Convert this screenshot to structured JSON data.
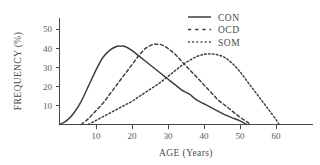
{
  "chart_data": {
    "type": "line",
    "title": "",
    "xlabel": "AGE (Years)",
    "ylabel": "FREQUENCY (%)",
    "xlim": [
      0,
      70
    ],
    "ylim": [
      0,
      57
    ],
    "xticks": [
      10,
      20,
      30,
      40,
      50,
      60
    ],
    "yticks": [
      10,
      20,
      30,
      40,
      50
    ],
    "grid": false,
    "legend_position": "top-right",
    "series": [
      {
        "name": "CON",
        "style": "solid",
        "peak_x": 17,
        "peak_y": 41,
        "x": [
          0,
          2,
          4,
          6,
          8,
          10,
          12,
          14,
          16,
          17,
          18,
          20,
          22,
          24,
          26,
          28,
          30,
          32,
          34,
          36,
          38,
          40,
          42,
          44,
          46,
          48,
          50,
          52
        ],
        "y": [
          0,
          2,
          6,
          12,
          20,
          28,
          35,
          39,
          41,
          41,
          41,
          39,
          36,
          33,
          30,
          27,
          24,
          21,
          18,
          16,
          13,
          11,
          9,
          7,
          5,
          3.5,
          2,
          0
        ]
      },
      {
        "name": "OCD",
        "style": "dashed",
        "peak_x": 27,
        "peak_y": 42,
        "x": [
          6,
          8,
          10,
          12,
          14,
          16,
          18,
          20,
          22,
          24,
          26,
          27,
          28,
          30,
          32,
          34,
          36,
          38,
          40,
          42,
          44,
          46,
          48,
          50,
          52,
          53
        ],
        "y": [
          0,
          3,
          7,
          11,
          16,
          21,
          26,
          31,
          36,
          40,
          42,
          42,
          42,
          40,
          37,
          33,
          29,
          25,
          21,
          17,
          13,
          10,
          7,
          4,
          1.5,
          0
        ]
      },
      {
        "name": "SOM",
        "style": "dotted",
        "peak_x": 42,
        "peak_y": 37,
        "x": [
          8,
          10,
          12,
          14,
          16,
          18,
          20,
          22,
          24,
          26,
          28,
          30,
          32,
          34,
          36,
          38,
          40,
          42,
          44,
          46,
          48,
          50,
          52,
          54,
          56,
          58,
          60,
          61
        ],
        "y": [
          0,
          2,
          4,
          6,
          8,
          10,
          12,
          14.5,
          17,
          19.5,
          22,
          25,
          28,
          31,
          33.5,
          35.5,
          36.7,
          37,
          36.5,
          35,
          32,
          28,
          23,
          18,
          13,
          8,
          3,
          0
        ]
      }
    ]
  },
  "legend": {
    "items": [
      {
        "label": "CON"
      },
      {
        "label": "OCD"
      },
      {
        "label": "SOM"
      }
    ]
  },
  "axes": {
    "x_title": "AGE (Years)",
    "y_title": "FREQUENCY (%)",
    "x_tick_labels": [
      "10",
      "20",
      "30",
      "40",
      "50",
      "60"
    ],
    "y_tick_labels": [
      "10",
      "20",
      "30",
      "40",
      "50"
    ]
  },
  "colors": {
    "ink": "#3d3d3d",
    "axis": "#4a4a4a",
    "tick_text": "#5a5a5a",
    "background": "#ffffff"
  }
}
